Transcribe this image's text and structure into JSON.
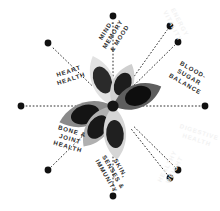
{
  "diagram": {
    "type": "radial-spoke-wheel",
    "center": {
      "x": 113,
      "y": 106
    },
    "hub_color": "#1a1a1a",
    "background_color": "#ffffff",
    "spoke_count": 8,
    "spoke_style": "dotted",
    "spoke_color": "#2b2b2b",
    "endpoint_dot_color": "#111111",
    "endpoint_dot_radius": 3.4,
    "spoke_inner_radius": 30,
    "spoke_outer_radius": 91,
    "label_text_color": "#2b2b2b",
    "ghost_label_text_color": "#f2f2f2",
    "spokes": [
      {
        "id": "mind-memory-mood",
        "label": "MIND,\nMEMORY\n& MOOD",
        "angle_deg": -90,
        "visible": true,
        "endpoint": {
          "x": 113,
          "y": 16
        },
        "label_pos": {
          "x": 85,
          "y": 22
        },
        "label_rotation_deg": -58
      },
      {
        "id": "blood-sugar-balance",
        "label": "BLOOD-\nSUGAR\nBALANCE",
        "angle_deg": -45,
        "visible": true,
        "endpoint": {
          "x": 178,
          "y": 42
        },
        "label_pos": {
          "x": 161,
          "y": 65
        },
        "label_rotation_deg": 30
      },
      {
        "id": "heart-health",
        "label": "HEART\nHEALTH",
        "angle_deg": -135,
        "visible": true,
        "endpoint": {
          "x": 48,
          "y": 43
        },
        "label_pos": {
          "x": 42,
          "y": 67
        },
        "label_rotation_deg": -18
      },
      {
        "id": "bone-joint-health",
        "label": "BONE &\nJOINT\nHEALTH",
        "angle_deg": 135,
        "visible": true,
        "endpoint": {
          "x": 48,
          "y": 170
        },
        "label_pos": {
          "x": 42,
          "y": 127
        },
        "label_rotation_deg": 16
      },
      {
        "id": "skin-senses-immunity",
        "label": "SKIN,\nSENSES &\nIMMUNITY",
        "angle_deg": 90,
        "visible": true,
        "endpoint": {
          "x": 113,
          "y": 196
        },
        "label_pos": {
          "x": 85,
          "y": 160
        },
        "label_rotation_deg": 60
      },
      {
        "id": "ghost-upper-right",
        "label": "ENERGY\nVITALITY",
        "angle_deg": -60,
        "visible": false,
        "endpoint": {
          "x": 170,
          "y": 26
        },
        "label_pos": {
          "x": 148,
          "y": 16
        },
        "label_rotation_deg": 62
      },
      {
        "id": "ghost-right-lower",
        "label": "DIGESTIVE\nHEALTH",
        "angle_deg": 30,
        "visible": false,
        "endpoint": {
          "x": 205,
          "y": 106
        },
        "label_pos": {
          "x": 170,
          "y": 128
        },
        "label_rotation_deg": 18
      },
      {
        "id": "ghost-lower-right",
        "label": "HEALTHY\nWEIGHT",
        "angle_deg": 60,
        "visible": false,
        "endpoint": {
          "x": 170,
          "y": 178
        },
        "label_pos": {
          "x": 143,
          "y": 160
        },
        "label_rotation_deg": -62
      }
    ],
    "extra_endpoints": [
      {
        "id": "endpoint-left",
        "x": 21,
        "y": 106
      },
      {
        "id": "endpoint-right",
        "x": 205,
        "y": 106
      },
      {
        "id": "endpoint-upper-right",
        "x": 178,
        "y": 42
      },
      {
        "id": "endpoint-lower-right",
        "x": 178,
        "y": 170
      }
    ],
    "flower": {
      "id": "center-flower",
      "petal_count": 6,
      "outer_petal_colors": [
        "#b9b9b9",
        "#8f8f8f",
        "#cfcfcf",
        "#dcdcdc",
        "#a8a8a8",
        "#6e6e6e"
      ],
      "inner_petal_colors": [
        "#1c1c1c",
        "#111111",
        "#262626",
        "#2e2e2e",
        "#1a1a1a",
        "#0d0d0d"
      ],
      "petals": [
        {
          "angle_deg": -112,
          "length": 54,
          "width": 16,
          "outer": "#e2e2e2",
          "inner": "#2a2a2a"
        },
        {
          "angle_deg": -66,
          "length": 46,
          "width": 15,
          "outer": "#cfcfcf",
          "inner": "#1c1c1c"
        },
        {
          "angle_deg": -22,
          "length": 52,
          "width": 17,
          "outer": "#5e5e5e",
          "inner": "#0e0e0e"
        },
        {
          "angle_deg": 163,
          "length": 56,
          "width": 17,
          "outer": "#8a8a8a",
          "inner": "#141414"
        },
        {
          "angle_deg": 126,
          "length": 50,
          "width": 16,
          "outer": "#b0b0b0",
          "inner": "#181818"
        },
        {
          "angle_deg": 86,
          "length": 54,
          "width": 16,
          "outer": "#d6d6d6",
          "inner": "#202020"
        }
      ]
    }
  }
}
